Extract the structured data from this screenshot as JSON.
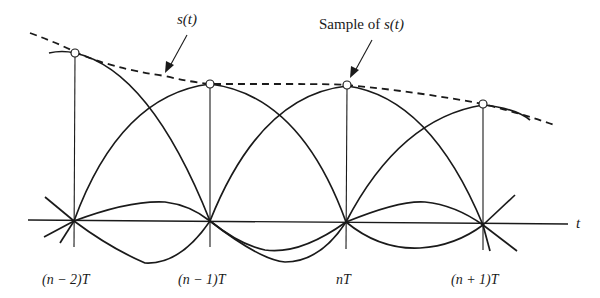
{
  "figure": {
    "labels": {
      "signal": "s(t)",
      "sample_prefix": "Sample of ",
      "sample_signal": "s(t)",
      "axis": "t"
    },
    "ticks": [
      {
        "label": "(n − 2)T"
      },
      {
        "label": "(n − 1)T"
      },
      {
        "label": "nT"
      },
      {
        "label": "(n + 1)T"
      }
    ]
  }
}
